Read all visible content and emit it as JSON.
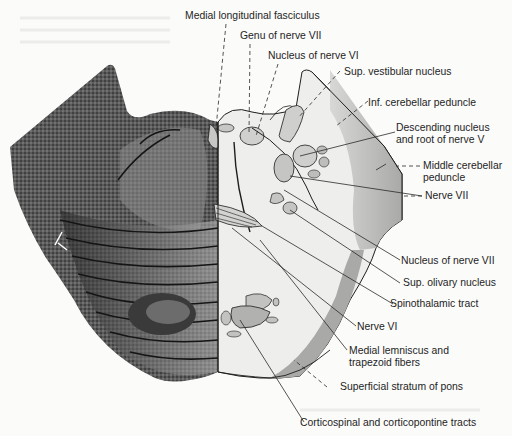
{
  "figure": {
    "colors": {
      "background": "#fbfbfa",
      "stain_dark": "#2a2a2a",
      "stain_mid": "#8a8a8a",
      "schematic_fill": "#e9e9e7",
      "schematic_shade": "#b8b8b6",
      "line": "#1e1e1e"
    }
  },
  "labels": {
    "medial_longitudinal_fasciculus": "Medial longitudinal fasciculus",
    "genu_nerve_vii": "Genu of nerve VII",
    "nucleus_nerve_vi": "Nucleus of nerve VI",
    "sup_vestibular_nucleus": "Sup. vestibular nucleus",
    "inf_cerebellar_peduncle": "Inf. cerebellar peduncle",
    "descending_nucleus_line1": "Descending nucleus",
    "descending_nucleus_line2": "and root of nerve V",
    "middle_cerebellar_line1": "Middle cerebellar",
    "middle_cerebellar_line2": "peduncle",
    "nerve_vii": "Nerve VII",
    "nucleus_nerve_vii": "Nucleus of nerve VII",
    "sup_olivary_nucleus": "Sup. olivary nucleus",
    "spinothalamic_tract": "Spinothalamic tract",
    "nerve_vi": "Nerve VI",
    "medial_lemniscus_line1": "Medial lemniscus and",
    "medial_lemniscus_line2": "trapezoid fibers",
    "superficial_stratum": "Superficial stratum of pons",
    "corticospinal": "Corticospinal and corticopontine tracts"
  }
}
